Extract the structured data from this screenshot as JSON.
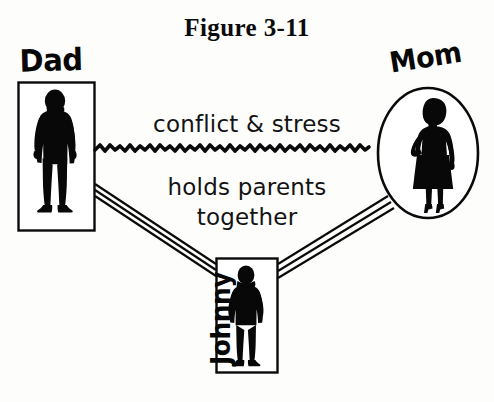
{
  "figure": {
    "title": "Figure 3-11",
    "background_color": "#fdfdfc",
    "ink_color": "#000000"
  },
  "nodes": [
    {
      "id": "dad",
      "label": "Dad",
      "shape": "rectangle",
      "icon": "adult-man-silhouette",
      "label_position": "above"
    },
    {
      "id": "mom",
      "label": "Mom",
      "shape": "oval",
      "icon": "adult-woman-silhouette",
      "label_position": "above"
    },
    {
      "id": "johnny",
      "label": "Johnny",
      "shape": "rectangle",
      "icon": "boy-silhouette",
      "label_position": "left-rotated"
    }
  ],
  "relations": {
    "conflict": {
      "label": "conflict & stress",
      "line_style": "jagged-wavy",
      "from": "dad",
      "to": "mom"
    },
    "holds": {
      "label_line_1": "holds parents",
      "label_line_2": "together",
      "line_style": "triple-parallel",
      "from": "johnny",
      "to": "dad and mom"
    }
  }
}
